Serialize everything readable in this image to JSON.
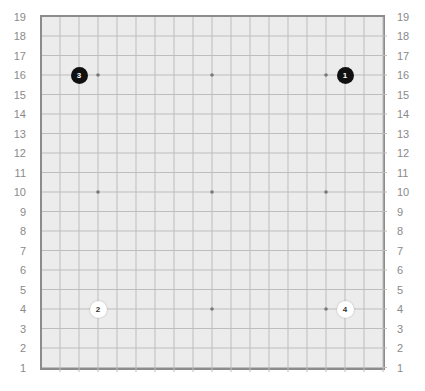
{
  "board": {
    "size": 19,
    "colors": {
      "background": "#ececec",
      "grid_line": "#bdbdbd",
      "border": "#8c8c8c",
      "star_point": "#7a7a7a",
      "label": "#8a8a8a",
      "black_stone": "#111111",
      "white_stone": "#ffffff"
    },
    "row_labels": [
      "19",
      "18",
      "17",
      "16",
      "15",
      "14",
      "13",
      "12",
      "11",
      "10",
      "9",
      "8",
      "7",
      "6",
      "5",
      "4",
      "3",
      "2",
      "1"
    ],
    "star_points": [
      [
        4,
        16
      ],
      [
        10,
        16
      ],
      [
        16,
        16
      ],
      [
        4,
        10
      ],
      [
        10,
        10
      ],
      [
        16,
        10
      ],
      [
        4,
        4
      ],
      [
        10,
        4
      ],
      [
        16,
        4
      ]
    ],
    "stones": [
      {
        "move": "1",
        "color": "black",
        "col": 17,
        "row": 16
      },
      {
        "move": "2",
        "color": "white",
        "col": 4,
        "row": 4
      },
      {
        "move": "3",
        "color": "black",
        "col": 3,
        "row": 16
      },
      {
        "move": "4",
        "color": "white",
        "col": 17,
        "row": 4
      }
    ]
  }
}
